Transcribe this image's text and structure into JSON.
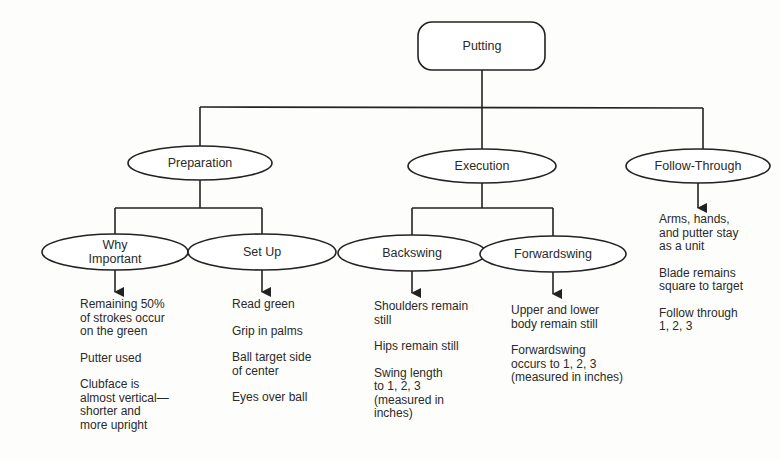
{
  "diagram": {
    "root": {
      "label": "Putting"
    },
    "phases": [
      {
        "label": "Preparation",
        "children": [
          {
            "label": "Why\nImportant",
            "notes": [
              "Remaining 50%\nof strokes occur\non the green",
              "Putter used",
              "Clubface is\nalmost vertical—\nshorter  and\nmore upright"
            ]
          },
          {
            "label": "Set Up",
            "notes": [
              "Read green",
              "Grip in palms",
              "Ball target side\nof center",
              "Eyes over ball"
            ]
          }
        ]
      },
      {
        "label": "Execution",
        "children": [
          {
            "label": "Backswing",
            "notes": [
              "Shoulders remain\nstill",
              "Hips remain still",
              "Swing length\nto 1, 2, 3\n(measured in\ninches)"
            ]
          },
          {
            "label": "Forwardswing",
            "notes": [
              "Upper and lower\nbody remain still",
              "Forwardswing\noccurs to 1, 2, 3\n(measured in inches)"
            ]
          }
        ]
      },
      {
        "label": "Follow-Through",
        "notes": [
          "Arms, hands,\nand putter stay\nas a unit",
          "Blade remains\nsquare to target",
          "Follow through\n1, 2, 3"
        ]
      }
    ]
  },
  "colors": {
    "stroke": "#222222",
    "background": "#fdfdfb",
    "text": "#2a2a2a"
  }
}
